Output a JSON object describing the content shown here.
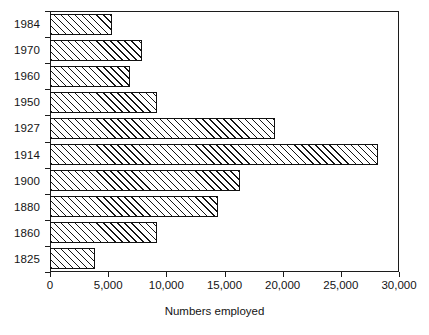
{
  "chart_data": {
    "type": "bar",
    "orientation": "horizontal",
    "title": "",
    "xlabel": "Numbers employed",
    "ylabel": "",
    "categories": [
      "1984",
      "1970",
      "1960",
      "1950",
      "1927",
      "1914",
      "1900",
      "1880",
      "1860",
      "1825"
    ],
    "values": [
      5300,
      7900,
      6900,
      9200,
      19300,
      28200,
      16300,
      14400,
      9200,
      3900
    ],
    "xlim": [
      0,
      30000
    ],
    "xticks": [
      0,
      5000,
      10000,
      15000,
      20000,
      25000,
      30000
    ],
    "xticklabels": [
      "0",
      "5,000",
      "10,000",
      "15,000",
      "20,000",
      "25,000",
      "30,000"
    ],
    "grid": false,
    "legend": null,
    "bar_style": "diagonal-hatch",
    "colors": {
      "bar_fill": "#ffffff",
      "bar_edge": "#111111",
      "hatch": "#151515",
      "axis": "#1c1c1c",
      "text": "#141414",
      "background": "#ffffff"
    }
  }
}
